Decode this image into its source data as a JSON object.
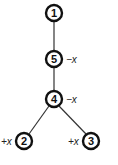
{
  "diagram": {
    "type": "tree",
    "nodes": [
      {
        "id": "1",
        "label": "1",
        "x": 54,
        "y": 13,
        "annotation": ""
      },
      {
        "id": "5",
        "label": "5",
        "x": 54,
        "y": 59,
        "annotation": "−x"
      },
      {
        "id": "4",
        "label": "4",
        "x": 54,
        "y": 99,
        "annotation": "−x"
      },
      {
        "id": "2",
        "label": "2",
        "x": 24,
        "y": 141,
        "annotation": "+x"
      },
      {
        "id": "3",
        "label": "3",
        "x": 91,
        "y": 141,
        "annotation": "+x"
      }
    ],
    "edges": [
      {
        "from": "1",
        "to": "5"
      },
      {
        "from": "5",
        "to": "4"
      },
      {
        "from": "4",
        "to": "2"
      },
      {
        "from": "4",
        "to": "3"
      }
    ],
    "colors": {
      "stroke": "#111111",
      "background": "#ffffff"
    }
  }
}
